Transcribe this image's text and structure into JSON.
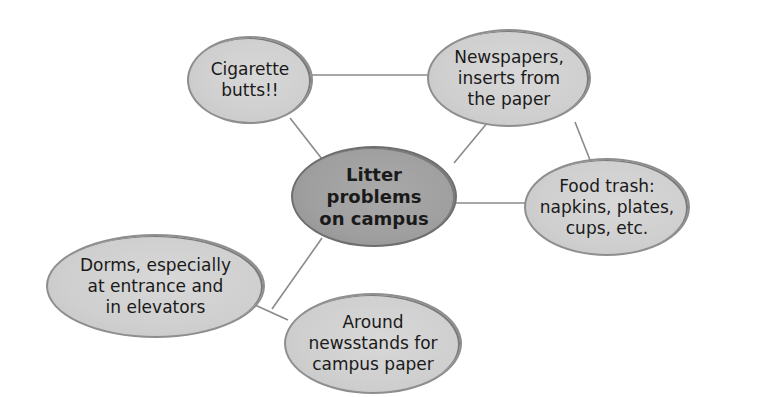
{
  "diagram": {
    "type": "cluster map",
    "center": {
      "id": "center",
      "text": "Litter\nproblems\non campus"
    },
    "nodes": [
      {
        "id": "cigarette",
        "text": "Cigarette\nbutts!!"
      },
      {
        "id": "newspapers",
        "text": "Newspapers,\ninserts from\nthe paper"
      },
      {
        "id": "food",
        "text": "Food trash:\nnapkins, plates,\ncups, etc."
      },
      {
        "id": "dorms",
        "text": "Dorms, especially\nat entrance and\nin elevators"
      },
      {
        "id": "around",
        "text": "Around\nnewsstands for\ncampus paper"
      }
    ],
    "edges": [
      [
        "cigarette",
        "newspapers"
      ],
      [
        "cigarette",
        "center"
      ],
      [
        "newspapers",
        "center"
      ],
      [
        "newspapers",
        "food"
      ],
      [
        "food",
        "center"
      ],
      [
        "center",
        "dorms-around-link"
      ],
      [
        "dorms",
        "around"
      ]
    ],
    "colors": {
      "center_fill": "#9f9f9f",
      "node_fill": "#d2d2d2",
      "outline": "#8e8e8e",
      "line": "#8a8a8a"
    }
  }
}
